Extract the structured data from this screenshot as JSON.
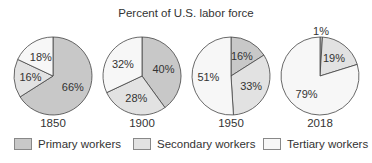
{
  "chart_data": {
    "type": "pie",
    "title": "Percent of U.S. labor force",
    "categories": [
      "Primary workers",
      "Secondary workers",
      "Tertiary workers"
    ],
    "colors": [
      "#c8c8c8",
      "#e2e2e2",
      "#f7f7f7"
    ],
    "pies": [
      {
        "label": "1850",
        "values": [
          66,
          16,
          18
        ]
      },
      {
        "label": "1900",
        "values": [
          40,
          28,
          32
        ]
      },
      {
        "label": "1950",
        "values": [
          16,
          33,
          51
        ]
      },
      {
        "label": "2018",
        "values": [
          1,
          19,
          79
        ]
      }
    ],
    "legend_position": "bottom"
  },
  "title": "Percent of U.S. labor force",
  "legend": [
    {
      "label": "Primary workers",
      "color": "#c8c8c8"
    },
    {
      "label": "Secondary workers",
      "color": "#e2e2e2"
    },
    {
      "label": "Tertiary workers",
      "color": "#f7f7f7"
    }
  ]
}
